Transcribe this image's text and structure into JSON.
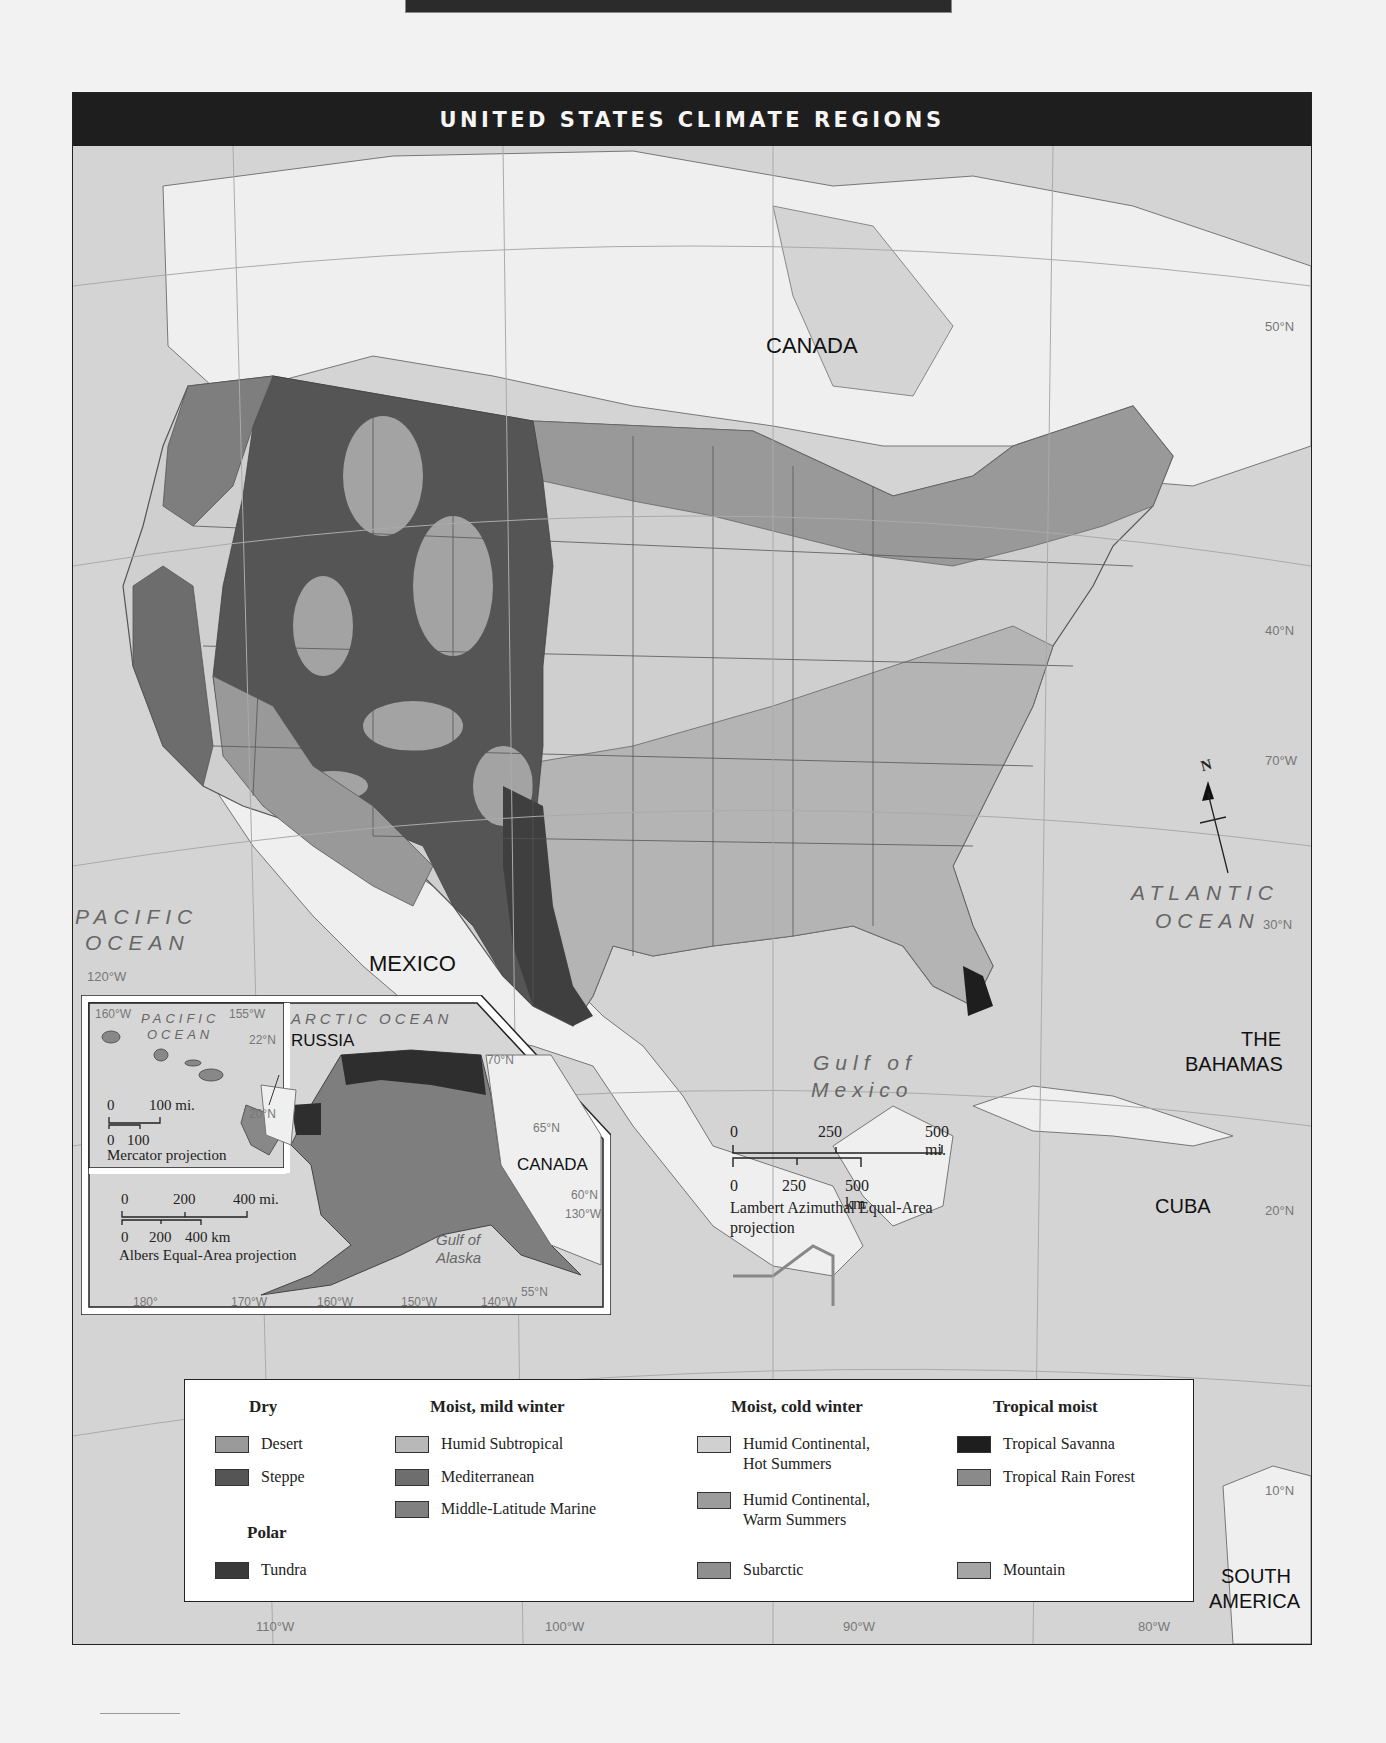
{
  "page": {
    "title": "UNITED STATES CLIMATE REGIONS"
  },
  "map": {
    "labels": {
      "canada": "CANADA",
      "mexico": "MEXICO",
      "pacific_ocean_1": "PACIFIC",
      "pacific_ocean_2": "OCEAN",
      "atlantic_ocean_1": "ATLANTIC",
      "atlantic_ocean_2": "OCEAN",
      "gulf_1": "Gulf of",
      "gulf_2": "Mexico",
      "bahamas_1": "THE",
      "bahamas_2": "BAHAMAS",
      "cuba": "CUBA",
      "south_america_1": "SOUTH",
      "south_america_2": "AMERICA"
    },
    "graticule": {
      "lat_50": "50°N",
      "lat_40": "40°N",
      "lat_30": "30°N",
      "lat_20": "20°N",
      "lat_10": "10°N",
      "lon_120": "120°W",
      "lon_110": "110°W",
      "lon_100": "100°W",
      "lon_90": "90°W",
      "lon_80": "80°W",
      "lon_70": "70°W"
    },
    "compass": {
      "north_label": "N"
    },
    "scale": {
      "mi_0": "0",
      "mi_250": "250",
      "mi_500": "500 mi.",
      "km_0": "0",
      "km_250": "250",
      "km_500": "500 km",
      "projection_1": "Lambert Azimuthal Equal-Area",
      "projection_2": "projection"
    }
  },
  "inset": {
    "hawaii": {
      "lon_160": "160°W",
      "lon_155": "155°W",
      "lat_22": "22°N",
      "lat_20": "20°N",
      "ocean_1": "PACIFIC",
      "ocean_2": "OCEAN",
      "scale_mi_0": "0",
      "scale_mi_100": "100 mi.",
      "scale_km_0": "0",
      "scale_km_100": "100",
      "projection": "Mercator projection"
    },
    "alaska": {
      "arctic_ocean": "ARCTIC OCEAN",
      "russia": "RUSSIA",
      "canada": "CANADA",
      "gulf_1": "Gulf of",
      "gulf_2": "Alaska",
      "lat_70": "70°N",
      "lat_65": "65°N",
      "lat_60": "60°N",
      "lat_55": "55°N",
      "lon_130": "130°W",
      "lon_140": "140°W",
      "lon_150": "150°W",
      "lon_160": "160°W",
      "lon_170": "170°W",
      "lon_180": "180°",
      "scale_mi_0": "0",
      "scale_mi_200": "200",
      "scale_mi_400": "400 mi.",
      "scale_km_0": "0",
      "scale_km_200": "200",
      "scale_km_400": "400 km",
      "projection": "Albers Equal-Area projection"
    }
  },
  "legend": {
    "groups": [
      {
        "heading": "Dry",
        "items": [
          {
            "label": "Desert",
            "color": "#9a9a9a"
          },
          {
            "label": "Steppe",
            "color": "#555555"
          }
        ]
      },
      {
        "heading": "Polar",
        "items": [
          {
            "label": "Tundra",
            "color": "#3a3a3a"
          }
        ]
      },
      {
        "heading": "Moist, mild winter",
        "items": [
          {
            "label": "Humid Subtropical",
            "color": "#b8b8b8"
          },
          {
            "label": "Mediterranean",
            "color": "#6e6e6e"
          },
          {
            "label": "Middle-Latitude Marine",
            "color": "#808080"
          }
        ]
      },
      {
        "heading": "Moist, cold winter",
        "items": [
          {
            "label": "Humid Continental, Hot Summers",
            "label_line1": "Humid Continental,",
            "label_line2": "Hot Summers",
            "color": "#d0d0d0"
          },
          {
            "label": "Humid Continental, Warm Summers",
            "label_line1": "Humid Continental,",
            "label_line2": "Warm Summers",
            "color": "#9c9c9c"
          },
          {
            "label": "Subarctic",
            "color": "#8f8f8f"
          }
        ]
      },
      {
        "heading": "Tropical moist",
        "items": [
          {
            "label": "Tropical Savanna",
            "color": "#1e1e1e"
          },
          {
            "label": "Tropical Rain Forest",
            "color": "#8a8a8a"
          },
          {
            "label": "Mountain",
            "color": "#a5a5a5"
          }
        ]
      }
    ]
  }
}
